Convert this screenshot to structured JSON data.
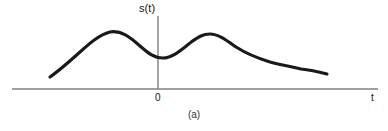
{
  "figure": {
    "caption": "(a)",
    "background_color": "#ffffff",
    "width": 388,
    "height": 131
  },
  "axes": {
    "y_axis_label": "s(t)",
    "x_axis_label": "t",
    "origin_label": "0",
    "axis_color": "#808080",
    "x_axis": {
      "x_start": 12,
      "x_end": 378,
      "y": 89
    },
    "y_axis": {
      "x": 158,
      "y_start": 16,
      "y_end": 89
    }
  },
  "chart_data": {
    "type": "line",
    "title": "",
    "subtitle": "",
    "xlabel": "t",
    "ylabel": "s(t)",
    "annotations": [
      "(a)"
    ],
    "legend": [],
    "grid": false,
    "series_color": "#1a1a1a",
    "xlim": [
      12,
      378
    ],
    "ylim": [
      89,
      16
    ],
    "points_pixel": [
      [
        50,
        77
      ],
      [
        62,
        68
      ],
      [
        76,
        56
      ],
      [
        90,
        43
      ],
      [
        100,
        36
      ],
      [
        110,
        32
      ],
      [
        122,
        33
      ],
      [
        133,
        39
      ],
      [
        144,
        48
      ],
      [
        153,
        55
      ],
      [
        163,
        58
      ],
      [
        173,
        56
      ],
      [
        183,
        49
      ],
      [
        194,
        40
      ],
      [
        202,
        35
      ],
      [
        210,
        34
      ],
      [
        221,
        37
      ],
      [
        233,
        44
      ],
      [
        246,
        52
      ],
      [
        259,
        58
      ],
      [
        273,
        62
      ],
      [
        287,
        66
      ],
      [
        299,
        68
      ],
      [
        310,
        70
      ],
      [
        319,
        73
      ],
      [
        327,
        74
      ]
    ],
    "path_d": "M 50 77 C 60 70, 70 61, 80 52 C 90 43, 99 35, 110 32 C 121 30, 130 37, 140 46 C 148 53, 154 58, 163 58 C 172 58, 180 51, 190 43 C 198 37, 203 34, 210 34 C 218 34, 226 40, 236 47 C 247 54, 257 58, 270 62 C 282 65, 292 67, 301 69 C 310 70, 319 72, 327 74",
    "features": {
      "start_point": [
        50,
        77
      ],
      "first_peak": [
        110,
        32
      ],
      "local_minimum": [
        163,
        58
      ],
      "second_peak": [
        210,
        34
      ],
      "shoulder": [
        300,
        68
      ],
      "end_point": [
        327,
        74
      ]
    }
  }
}
